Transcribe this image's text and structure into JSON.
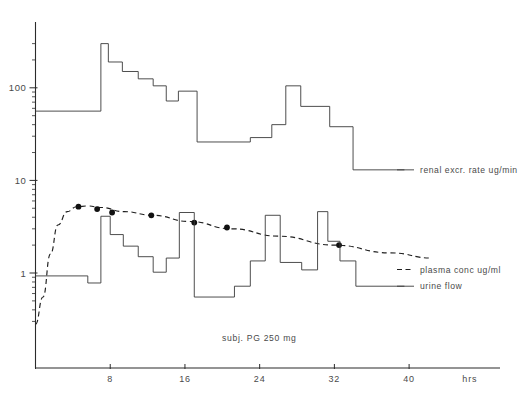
{
  "chart_data": {
    "type": "line",
    "title": "",
    "subtitle": "",
    "caption": "subj. PG   250 mg",
    "xlabel": "hrs",
    "ylabel": "",
    "yscale": "log",
    "ylim": [
      0.25,
      400
    ],
    "xlim": [
      -1,
      48
    ],
    "grid": false,
    "legend_position": "right-inline",
    "y_ticks": [
      1,
      10,
      100
    ],
    "y_tick_labels": [
      "1",
      "10",
      "100"
    ],
    "y_minor_ticks": [
      0.3,
      0.4,
      0.5,
      0.6,
      0.7,
      0.8,
      0.9,
      2,
      3,
      4,
      5,
      6,
      7,
      8,
      9,
      20,
      30,
      40,
      50,
      60,
      70,
      80,
      90,
      200,
      300
    ],
    "x_ticks": [
      0,
      8,
      16,
      24,
      32,
      40
    ],
    "x_tick_labels": [
      "",
      "8",
      "16",
      "24",
      "32",
      "40"
    ],
    "series": [
      {
        "name": "renal excr. rate ug/min",
        "label": "renal excr. rate ug/min",
        "type": "step",
        "units": "ug/min",
        "legend_sample": "solid",
        "steps": [
          {
            "x0": 0.0,
            "x1": 7.0,
            "y": 56
          },
          {
            "x0": 7.0,
            "x1": 7.8,
            "y": 300
          },
          {
            "x0": 7.8,
            "x1": 9.3,
            "y": 190
          },
          {
            "x0": 9.3,
            "x1": 11.0,
            "y": 150
          },
          {
            "x0": 11.0,
            "x1": 12.6,
            "y": 125
          },
          {
            "x0": 12.6,
            "x1": 14.0,
            "y": 105
          },
          {
            "x0": 14.0,
            "x1": 15.3,
            "y": 72
          },
          {
            "x0": 15.3,
            "x1": 17.3,
            "y": 92
          },
          {
            "x0": 17.3,
            "x1": 23.0,
            "y": 26
          },
          {
            "x0": 23.0,
            "x1": 25.3,
            "y": 29
          },
          {
            "x0": 25.3,
            "x1": 26.8,
            "y": 40
          },
          {
            "x0": 26.8,
            "x1": 28.4,
            "y": 105
          },
          {
            "x0": 28.4,
            "x1": 31.5,
            "y": 63
          },
          {
            "x0": 31.5,
            "x1": 34.0,
            "y": 38
          },
          {
            "x0": 34.0,
            "x1": 39.5,
            "y": 13
          }
        ]
      },
      {
        "name": "plasma conc ug/ml",
        "label": "plasma conc ug/ml",
        "type": "dashed-line",
        "units": "ug/ml",
        "legend_sample": "dashed",
        "curve": [
          {
            "x": 0.0,
            "y": 0.28
          },
          {
            "x": 0.8,
            "y": 0.55
          },
          {
            "x": 1.6,
            "y": 1.6
          },
          {
            "x": 2.4,
            "y": 3.3
          },
          {
            "x": 3.4,
            "y": 4.6
          },
          {
            "x": 4.4,
            "y": 5.2
          },
          {
            "x": 5.6,
            "y": 5.3
          },
          {
            "x": 7.0,
            "y": 5.1
          },
          {
            "x": 9.5,
            "y": 4.6
          },
          {
            "x": 12.5,
            "y": 4.2
          },
          {
            "x": 16.5,
            "y": 3.6
          },
          {
            "x": 21.0,
            "y": 3.0
          },
          {
            "x": 26.0,
            "y": 2.5
          },
          {
            "x": 32.0,
            "y": 2.0
          },
          {
            "x": 38.0,
            "y": 1.65
          },
          {
            "x": 42.5,
            "y": 1.45
          }
        ],
        "points": [
          {
            "x": 4.6,
            "y": 5.2
          },
          {
            "x": 6.6,
            "y": 4.9
          },
          {
            "x": 8.2,
            "y": 4.5
          },
          {
            "x": 12.4,
            "y": 4.2
          },
          {
            "x": 17.0,
            "y": 3.5
          },
          {
            "x": 20.5,
            "y": 3.1
          },
          {
            "x": 32.5,
            "y": 2.0
          }
        ]
      },
      {
        "name": "urine flow",
        "label": "urine flow",
        "type": "step",
        "units": "",
        "legend_sample": "solid",
        "steps": [
          {
            "x0": 0.0,
            "x1": 5.6,
            "y": 0.93
          },
          {
            "x0": 5.6,
            "x1": 7.0,
            "y": 0.78
          },
          {
            "x0": 7.0,
            "x1": 8.0,
            "y": 4.1
          },
          {
            "x0": 8.0,
            "x1": 9.4,
            "y": 2.6
          },
          {
            "x0": 9.4,
            "x1": 11.0,
            "y": 1.95
          },
          {
            "x0": 11.0,
            "x1": 12.6,
            "y": 1.5
          },
          {
            "x0": 12.6,
            "x1": 14.0,
            "y": 1.02
          },
          {
            "x0": 14.0,
            "x1": 15.4,
            "y": 1.45
          },
          {
            "x0": 15.4,
            "x1": 17.0,
            "y": 4.5
          },
          {
            "x0": 17.0,
            "x1": 21.3,
            "y": 0.55
          },
          {
            "x0": 21.3,
            "x1": 23.0,
            "y": 0.72
          },
          {
            "x0": 23.0,
            "x1": 24.6,
            "y": 1.35
          },
          {
            "x0": 24.6,
            "x1": 26.2,
            "y": 4.2
          },
          {
            "x0": 26.2,
            "x1": 28.5,
            "y": 1.3
          },
          {
            "x0": 28.5,
            "x1": 30.2,
            "y": 1.08
          },
          {
            "x0": 30.2,
            "x1": 31.3,
            "y": 4.6
          },
          {
            "x0": 31.3,
            "x1": 32.6,
            "y": 2.2
          },
          {
            "x0": 32.6,
            "x1": 34.3,
            "y": 1.35
          },
          {
            "x0": 34.3,
            "x1": 39.5,
            "y": 0.72
          }
        ]
      }
    ]
  },
  "labels": {
    "renal": "renal excr. rate ug/min",
    "plasma": "plasma conc ug/ml",
    "urine": "urine flow",
    "hrs": "hrs",
    "caption": "subj. PG   250 mg",
    "y100": "100",
    "y10": "10",
    "y1": "1",
    "x8": "8",
    "x16": "16",
    "x24": "24",
    "x32": "32",
    "x40": "40"
  },
  "colors": {
    "background": "#ffffff",
    "axis": "#2b2b2b",
    "series_line": "#3a3a3a",
    "dashed_line": "#1f1f1f",
    "marker": "#111111",
    "text": "#4a4a4a"
  }
}
